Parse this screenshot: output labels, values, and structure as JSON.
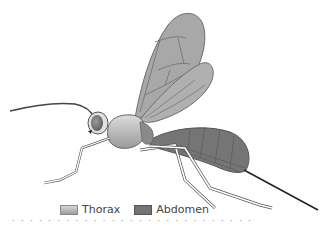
{
  "figure": {
    "colors": {
      "wing_fill": "#a8a8a8",
      "wing_vein": "#6e6e6e",
      "thorax_light": "#d8d8d8",
      "thorax_dark": "#9c9c9c",
      "abdomen": "#757575",
      "outline": "#555555",
      "ovipositor": "#222222"
    }
  },
  "legend": {
    "items": [
      {
        "label": "Thorax",
        "swatch": "thorax"
      },
      {
        "label": "Abdomen",
        "swatch": "abdomen"
      }
    ]
  },
  "caption": {
    "text": "· · · · · · · · · · · · · · · · · · · · · · · · · · ·"
  }
}
